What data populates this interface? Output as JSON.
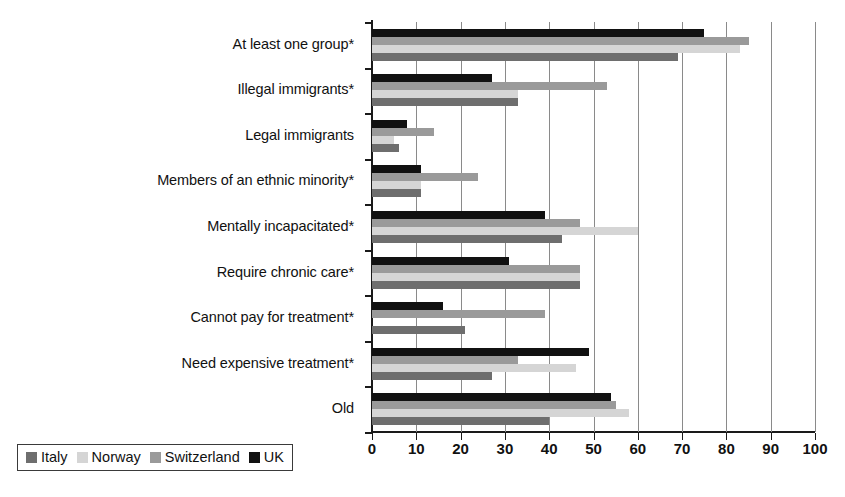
{
  "chart_data": {
    "type": "bar",
    "orientation": "horizontal",
    "title": "",
    "xlabel": "",
    "ylabel": "",
    "xlim": [
      0,
      100
    ],
    "xticks": [
      0,
      10,
      20,
      30,
      40,
      50,
      60,
      70,
      80,
      90,
      100
    ],
    "xtick_labels": [
      "0",
      "10",
      "20",
      "30",
      "40",
      "50",
      "60",
      "70",
      "80",
      "90",
      "100"
    ],
    "grid": true,
    "grid_axis": "x",
    "legend_position": "bottom-left",
    "categories": [
      "At least one group*",
      "Illegal immigrants*",
      "Legal immigrants",
      "Members of an ethnic minority*",
      "Mentally incapacitated*",
      "Require chronic care*",
      "Cannot pay for treatment*",
      "Need expensive treatment*",
      "Old"
    ],
    "series_order_top_to_bottom": [
      "UK",
      "Switzerland",
      "Norway",
      "Italy"
    ],
    "series": [
      {
        "name": "Italy",
        "color": "#6e6e6e",
        "values": [
          69,
          33,
          6,
          11,
          43,
          47,
          21,
          27,
          40
        ]
      },
      {
        "name": "Norway",
        "color": "#d5d5d5",
        "values": [
          83,
          33,
          5,
          11,
          60,
          47,
          0,
          46,
          58
        ]
      },
      {
        "name": "Switzerland",
        "color": "#9a9a9a",
        "values": [
          85,
          53,
          14,
          24,
          47,
          47,
          39,
          33,
          55
        ]
      },
      {
        "name": "UK",
        "color": "#111111",
        "values": [
          75,
          27,
          8,
          11,
          39,
          31,
          16,
          49,
          54
        ]
      }
    ]
  },
  "legend": {
    "items": [
      {
        "label": "Italy",
        "color": "#6e6e6e"
      },
      {
        "label": "Norway",
        "color": "#d5d5d5"
      },
      {
        "label": "Switzerland",
        "color": "#9a9a9a"
      },
      {
        "label": "UK",
        "color": "#111111"
      }
    ]
  },
  "colors": {
    "axis": "#1a1a1a",
    "grid": "#8a8a8a",
    "background": "#ffffff",
    "text": "#111111"
  }
}
